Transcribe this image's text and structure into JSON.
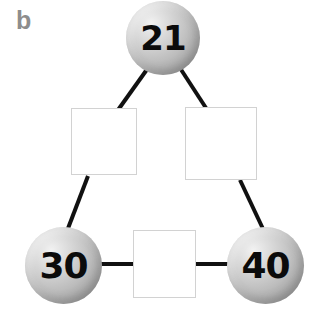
{
  "figure": {
    "panel_label": "b",
    "width": 328,
    "height": 323,
    "background_color": "#ffffff",
    "label_color": "#8d8d8d",
    "node_fill_light": "#f2f2f2",
    "node_fill_dark": "#8f8f8f",
    "node_text_color": "#0b0b0b",
    "edge_color": "#111111",
    "slot_border_color": "#d2d2d2",
    "slot_fill_color": "#ffffff"
  },
  "nodes": [
    {
      "id": "top",
      "label": "21",
      "cx": 163,
      "cy": 38,
      "r": 37
    },
    {
      "id": "bottom_left",
      "label": "30",
      "cx": 63,
      "cy": 265,
      "r": 38
    },
    {
      "id": "bottom_right",
      "label": "40",
      "cx": 266,
      "cy": 265,
      "r": 38
    }
  ],
  "slots": [
    {
      "id": "slot_left",
      "label": "",
      "x": 71,
      "y": 108,
      "w": 66,
      "h": 67
    },
    {
      "id": "slot_right",
      "label": "",
      "x": 185,
      "y": 107,
      "w": 72,
      "h": 73
    },
    {
      "id": "slot_bottom",
      "label": "",
      "x": 133,
      "y": 230,
      "w": 63,
      "h": 68
    }
  ],
  "edges": [
    {
      "id": "top_to_left_slot",
      "x1": 148,
      "y1": 68,
      "x2": 118,
      "y2": 110
    },
    {
      "id": "top_to_right_slot",
      "x1": 180,
      "y1": 68,
      "x2": 206,
      "y2": 108
    },
    {
      "id": "left_slot_to_bottom_left",
      "x1": 88,
      "y1": 176,
      "x2": 67,
      "y2": 229
    },
    {
      "id": "right_slot_to_bottom_right",
      "x1": 240,
      "y1": 180,
      "x2": 265,
      "y2": 229
    },
    {
      "id": "bottom_left_to_bottom_slot",
      "x1": 99,
      "y1": 264,
      "x2": 134,
      "y2": 264
    },
    {
      "id": "bottom_slot_to_bottom_right",
      "x1": 195,
      "y1": 264,
      "x2": 231,
      "y2": 264
    }
  ]
}
